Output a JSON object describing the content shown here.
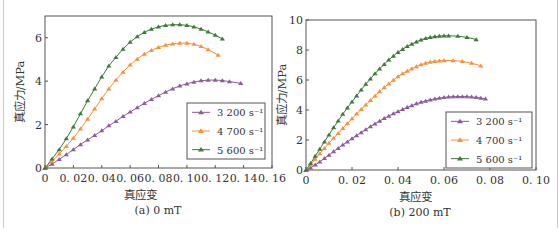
{
  "chart_data": [
    {
      "type": "line",
      "title": "",
      "caption": "(a) 0 mT",
      "xlabel": "真应变",
      "ylabel": "真应力/MPa",
      "xlim": [
        0,
        0.16
      ],
      "ylim": [
        0,
        7
      ],
      "xticks": [
        0,
        0.02,
        0.04,
        0.06,
        0.08,
        0.1,
        0.12,
        0.14,
        0.16
      ],
      "xtick_labels": [
        "0",
        "0. 02",
        "0. 04",
        "0. 06",
        "0. 08",
        "0. 10",
        "0. 12",
        "0. 14",
        "0. 16"
      ],
      "yticks": [
        0,
        2,
        4,
        6
      ],
      "ytick_labels": [
        "0",
        "2",
        "4",
        "6"
      ],
      "grid": false,
      "legend_position": "lower right",
      "series": [
        {
          "name": "3 200 s⁻¹",
          "color": "#8e5a9e",
          "marker": "triangle",
          "x": [
            0,
            0.005,
            0.01,
            0.015,
            0.02,
            0.025,
            0.03,
            0.035,
            0.04,
            0.045,
            0.05,
            0.055,
            0.06,
            0.065,
            0.07,
            0.075,
            0.08,
            0.085,
            0.09,
            0.095,
            0.1,
            0.105,
            0.11,
            0.115,
            0.12,
            0.125,
            0.13,
            0.138
          ],
          "y": [
            0,
            0.18,
            0.4,
            0.62,
            0.85,
            1.08,
            1.3,
            1.5,
            1.72,
            1.95,
            2.15,
            2.38,
            2.58,
            2.78,
            2.98,
            3.16,
            3.33,
            3.5,
            3.65,
            3.78,
            3.88,
            3.96,
            4.02,
            4.05,
            4.05,
            4.03,
            3.98,
            3.9
          ]
        },
        {
          "name": "4 700 s⁻¹",
          "color": "#f7913a",
          "marker": "triangle",
          "x": [
            0,
            0.005,
            0.01,
            0.015,
            0.02,
            0.025,
            0.03,
            0.035,
            0.04,
            0.045,
            0.05,
            0.055,
            0.06,
            0.065,
            0.07,
            0.075,
            0.08,
            0.085,
            0.09,
            0.095,
            0.1,
            0.105,
            0.11,
            0.115,
            0.122
          ],
          "y": [
            0,
            0.3,
            0.65,
            1.0,
            1.38,
            1.8,
            2.25,
            2.72,
            3.2,
            3.65,
            4.05,
            4.42,
            4.75,
            5.02,
            5.25,
            5.42,
            5.56,
            5.66,
            5.72,
            5.75,
            5.75,
            5.7,
            5.6,
            5.45,
            5.2
          ]
        },
        {
          "name": "5 600 s⁻¹",
          "color": "#3e7a3a",
          "marker": "triangle",
          "x": [
            0,
            0.005,
            0.01,
            0.015,
            0.02,
            0.025,
            0.03,
            0.035,
            0.04,
            0.045,
            0.05,
            0.055,
            0.06,
            0.065,
            0.07,
            0.075,
            0.08,
            0.085,
            0.09,
            0.095,
            0.1,
            0.105,
            0.11,
            0.115,
            0.12,
            0.125
          ],
          "y": [
            0,
            0.42,
            0.85,
            1.35,
            1.9,
            2.5,
            3.1,
            3.65,
            4.2,
            4.7,
            5.1,
            5.48,
            5.8,
            6.05,
            6.25,
            6.4,
            6.5,
            6.57,
            6.6,
            6.6,
            6.57,
            6.5,
            6.4,
            6.27,
            6.12,
            5.95
          ]
        }
      ]
    },
    {
      "type": "line",
      "title": "",
      "caption": "(b) 200 mT",
      "xlabel": "真应变",
      "ylabel": "真应力/MPa",
      "xlim": [
        0,
        0.1
      ],
      "ylim": [
        0,
        10
      ],
      "xticks": [
        0,
        0.02,
        0.04,
        0.06,
        0.08,
        0.1
      ],
      "xtick_labels": [
        "0",
        "0. 02",
        "0. 04",
        "0. 06",
        "0. 08",
        "0. 10"
      ],
      "yticks": [
        0,
        2,
        4,
        6,
        8,
        10
      ],
      "ytick_labels": [
        "0",
        "2",
        "4",
        "6",
        "8",
        "10"
      ],
      "grid": false,
      "legend_position": "lower right",
      "series": [
        {
          "name": "3 200 s⁻¹",
          "color": "#8e5a9e",
          "marker": "triangle",
          "x": [
            0,
            0.002,
            0.004,
            0.006,
            0.008,
            0.01,
            0.012,
            0.014,
            0.016,
            0.018,
            0.02,
            0.022,
            0.024,
            0.026,
            0.028,
            0.03,
            0.032,
            0.034,
            0.036,
            0.038,
            0.04,
            0.042,
            0.044,
            0.046,
            0.048,
            0.05,
            0.052,
            0.054,
            0.056,
            0.058,
            0.06,
            0.062,
            0.064,
            0.066,
            0.068,
            0.07,
            0.072,
            0.074,
            0.076,
            0.078
          ],
          "y": [
            0,
            0.15,
            0.35,
            0.55,
            0.78,
            1.0,
            1.22,
            1.45,
            1.67,
            1.88,
            2.1,
            2.3,
            2.5,
            2.7,
            2.9,
            3.08,
            3.26,
            3.44,
            3.6,
            3.76,
            3.9,
            4.04,
            4.17,
            4.3,
            4.42,
            4.52,
            4.6,
            4.68,
            4.74,
            4.8,
            4.84,
            4.87,
            4.89,
            4.9,
            4.9,
            4.89,
            4.87,
            4.84,
            4.8,
            4.75
          ]
        },
        {
          "name": "4 700 s⁻¹",
          "color": "#f7913a",
          "marker": "triangle",
          "x": [
            0,
            0.002,
            0.004,
            0.006,
            0.008,
            0.01,
            0.012,
            0.014,
            0.016,
            0.018,
            0.02,
            0.022,
            0.024,
            0.026,
            0.028,
            0.03,
            0.032,
            0.034,
            0.036,
            0.038,
            0.04,
            0.042,
            0.044,
            0.046,
            0.048,
            0.05,
            0.052,
            0.054,
            0.056,
            0.058,
            0.06,
            0.064,
            0.068,
            0.072,
            0.076
          ],
          "y": [
            0,
            0.35,
            0.72,
            1.1,
            1.45,
            1.8,
            2.12,
            2.45,
            2.78,
            3.1,
            3.42,
            3.75,
            4.05,
            4.35,
            4.65,
            4.95,
            5.22,
            5.5,
            5.75,
            6.0,
            6.22,
            6.42,
            6.6,
            6.76,
            6.9,
            7.02,
            7.12,
            7.2,
            7.25,
            7.28,
            7.3,
            7.3,
            7.25,
            7.12,
            6.95
          ]
        },
        {
          "name": "5 600 s⁻¹",
          "color": "#3e7a3a",
          "marker": "triangle",
          "x": [
            0,
            0.002,
            0.004,
            0.006,
            0.008,
            0.01,
            0.012,
            0.014,
            0.016,
            0.018,
            0.02,
            0.022,
            0.024,
            0.026,
            0.028,
            0.03,
            0.032,
            0.034,
            0.036,
            0.038,
            0.04,
            0.042,
            0.044,
            0.046,
            0.048,
            0.05,
            0.052,
            0.054,
            0.056,
            0.058,
            0.06,
            0.062,
            0.066,
            0.07,
            0.074
          ],
          "y": [
            0,
            0.45,
            0.92,
            1.4,
            1.88,
            2.35,
            2.82,
            3.28,
            3.72,
            4.15,
            4.55,
            4.95,
            5.35,
            5.72,
            6.08,
            6.42,
            6.75,
            7.05,
            7.35,
            7.6,
            7.85,
            8.05,
            8.25,
            8.4,
            8.55,
            8.68,
            8.78,
            8.85,
            8.9,
            8.93,
            8.95,
            8.95,
            8.93,
            8.85,
            8.7
          ]
        }
      ]
    }
  ]
}
